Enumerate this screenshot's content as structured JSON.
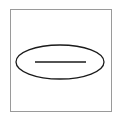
{
  "symbol": {
    "name": "ellipse-with-line",
    "frame_color": "#9a9a9a",
    "stroke_color": "#1a1a1a",
    "ellipse": {
      "cx": 60,
      "cy": 62,
      "rx": 44,
      "ry": 17
    },
    "line": {
      "x1": 35,
      "y1": 62,
      "x2": 86,
      "y2": 62
    }
  }
}
